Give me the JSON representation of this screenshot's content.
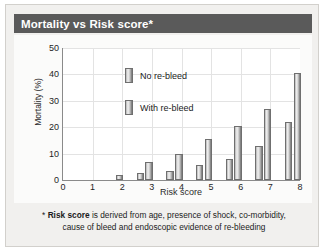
{
  "card": {
    "title": "Mortality vs Risk score*"
  },
  "footnote": {
    "marker": "*",
    "bold_term": "Risk score",
    "line1_rest": " is derived from age, presence of shock, co-morbidity,",
    "line2": "cause of bleed and endoscopic evidence of re-bleeding"
  },
  "chart_data": {
    "type": "bar",
    "title": "Mortality vs Risk score*",
    "xlabel": "Risk score",
    "ylabel": "Mortality (%)",
    "categories": [
      0,
      1,
      2,
      3,
      4,
      5,
      6,
      7,
      8
    ],
    "xticks": [
      "0",
      "1",
      "2",
      "3",
      "4",
      "5",
      "6",
      "7",
      "8"
    ],
    "yticks": [
      "0",
      "10",
      "20",
      "30",
      "40",
      "50"
    ],
    "ylim": [
      0,
      50
    ],
    "xlim": [
      0,
      8
    ],
    "grid": true,
    "legend_position": "upper-left-inside",
    "series": [
      {
        "name": "No re-bleed",
        "values": [
          0,
          0,
          0,
          2.5,
          3.5,
          5.5,
          8,
          13,
          22
        ]
      },
      {
        "name": "With re-bleed",
        "values": [
          0,
          0,
          2,
          7,
          10,
          15.5,
          20.5,
          27,
          40.5
        ]
      }
    ]
  }
}
